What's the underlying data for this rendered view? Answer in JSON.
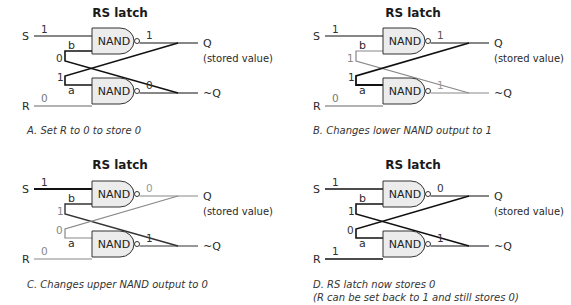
{
  "colors": {
    "active": "#111111",
    "inactive": "#9a9a9a",
    "gate_fill": "#ececec"
  },
  "panels": [
    {
      "id": "A",
      "title": "RS latch",
      "gate_label": "NAND",
      "inputs": {
        "S": "S",
        "R": "R"
      },
      "outputs": {
        "Q": "Q",
        "notQ": "~Q",
        "stored": "(stored value)"
      },
      "pins": {
        "b": "b",
        "a": "a"
      },
      "values": {
        "S": "1",
        "R": "0",
        "b": "0",
        "a": "1",
        "upper_out": "1",
        "lower_out": "0"
      },
      "styles": {
        "S": "inactive_thin",
        "R": "inactive_thin",
        "b": "active",
        "a": "active",
        "upper_out": "active",
        "lower_out": "active",
        "cross_q_to_a": "active",
        "cross_nq_to_b": "active",
        "v_S": "active",
        "v_R": "inactive",
        "v_b": "active",
        "v_a": "active",
        "v_up": "active",
        "v_lo": "active"
      },
      "caption": [
        "A. Set R to 0 to store 0"
      ]
    },
    {
      "id": "B",
      "title": "RS latch",
      "gate_label": "NAND",
      "inputs": {
        "S": "S",
        "R": "R"
      },
      "outputs": {
        "Q": "Q",
        "notQ": "~Q",
        "stored": "(stored value)"
      },
      "pins": {
        "b": "b",
        "a": "a"
      },
      "values": {
        "S": "1",
        "R": "0",
        "b": "1",
        "a": "1",
        "upper_out": "1",
        "lower_out": "1"
      },
      "caption": [
        "B. Changes lower NAND output to 1"
      ]
    },
    {
      "id": "C",
      "title": "RS latch",
      "gate_label": "NAND",
      "inputs": {
        "S": "S",
        "R": "R"
      },
      "outputs": {
        "Q": "Q",
        "notQ": "~Q",
        "stored": "(stored value)"
      },
      "pins": {
        "b": "b",
        "a": "a"
      },
      "values": {
        "S": "1",
        "R": "0",
        "b": "1",
        "a": "0",
        "upper_out": "0",
        "lower_out": "1"
      },
      "caption": [
        "C. Changes upper NAND output to 0"
      ]
    },
    {
      "id": "D",
      "title": "RS latch",
      "gate_label": "NAND",
      "inputs": {
        "S": "S",
        "R": "R"
      },
      "outputs": {
        "Q": "Q",
        "notQ": "~Q",
        "stored": "(stored value)"
      },
      "pins": {
        "b": "b",
        "a": "a"
      },
      "values": {
        "S": "1",
        "R": "1",
        "b": "1",
        "a": "0",
        "upper_out": "0",
        "lower_out": "1"
      },
      "caption": [
        "D. RS latch now stores 0",
        "(R can be set back to 1 and still stores 0)"
      ]
    }
  ]
}
